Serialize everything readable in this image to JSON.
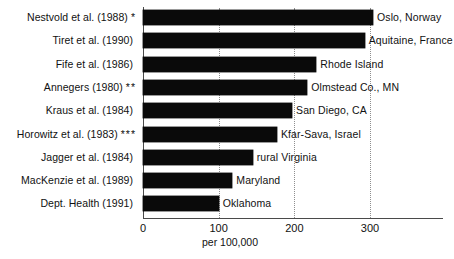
{
  "chart_data": {
    "type": "bar",
    "orientation": "horizontal",
    "title": "",
    "xlabel": "per 100,000",
    "ylabel": "",
    "xlim": [
      0,
      320
    ],
    "xticks": [
      0,
      100,
      200,
      300
    ],
    "xtick_labels": [
      "0",
      "100",
      "200",
      "300"
    ],
    "grid": "vertical-dotted",
    "legend": "none",
    "categories": [
      "Nestvold et al. (1988)",
      "Tiret et al. (1990)",
      "Fife et al. (1986)",
      "Annegers (1980)",
      "Kraus et al. (1984)",
      "Horowitz et al. (1983)",
      "Jagger et al. (1984)",
      "MacKenzie et al. (1989)",
      "Dept. Health (1991)"
    ],
    "category_markers": [
      "*",
      "",
      "",
      "**",
      "",
      "***",
      "",
      "",
      ""
    ],
    "values": [
      304,
      293,
      229,
      217,
      197,
      177,
      145,
      118,
      100
    ],
    "point_labels": [
      "Oslo, Norway",
      "Aquitaine, France",
      "Rhode Island",
      "Olmstead Co., MN",
      "San Diego, CA",
      "Kfar-Sava, Israel",
      "rural Virginia",
      "Maryland",
      "Oklahoma"
    ],
    "bar_color": "#0a0a0a",
    "background_color": "#ffffff"
  }
}
